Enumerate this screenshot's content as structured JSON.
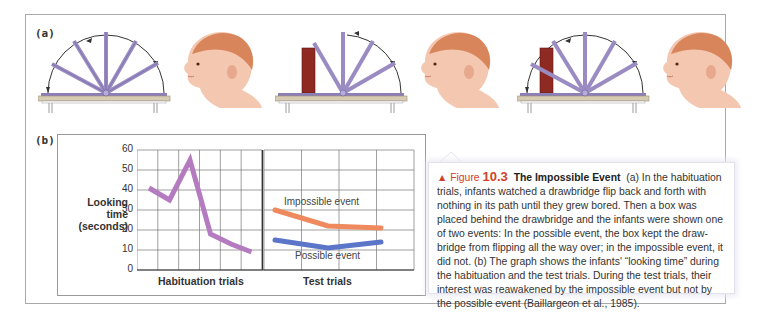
{
  "figure": {
    "panel_a_label": "(a)",
    "panel_b_label": "(b)",
    "scenes": [
      {
        "name": "habituation",
        "box": false,
        "description": "drawbridge flipping full 180 degrees, infant watching"
      },
      {
        "name": "possible-event",
        "box": true,
        "description": "box stops drawbridge, infant watching"
      },
      {
        "name": "impossible-event",
        "box": true,
        "description": "drawbridge passes through box, infant watching"
      }
    ],
    "colors": {
      "drawbridge": "#9a8cc2",
      "box": "#8e2a22",
      "table": "#d8cbb4",
      "habituation_line": "#b57bc0",
      "impossible_line": "#ef8a5e",
      "possible_line": "#5b75c9",
      "caption_accent": "#d2412a"
    }
  },
  "chart_data": {
    "type": "line",
    "title": "",
    "ylabel": "Looking time (seconds)",
    "ylabel_lines": [
      "Looking",
      "time",
      "(seconds)"
    ],
    "ylim": [
      0,
      60
    ],
    "yticks": [
      0,
      10,
      20,
      30,
      40,
      50,
      60
    ],
    "grid": true,
    "panels": [
      {
        "xlabel": "Habituation trials",
        "series": [
          {
            "name": "Habituation",
            "x": [
              1,
              2,
              3,
              4,
              5,
              6
            ],
            "values": [
              41,
              35,
              55,
              18,
              13,
              9
            ]
          }
        ]
      },
      {
        "xlabel": "Test trials",
        "series": [
          {
            "name": "Impossible event",
            "x": [
              1,
              2,
              3
            ],
            "values": [
              30,
              22,
              21
            ]
          },
          {
            "name": "Possible event",
            "x": [
              1,
              2,
              3
            ],
            "values": [
              15,
              11,
              14
            ]
          }
        ]
      }
    ]
  },
  "caption": {
    "marker": "▲",
    "figure_word": "Figure",
    "figure_number": "10.3",
    "title": "The Impossible Event",
    "body": "(a) In the habituation trials, infants watched a drawbridge flip back and forth with nothing in its path until they grew bored. Then a box was placed behind the drawbridge and the infants were shown one of two events: In the possible event, the box kept the draw-bridge from flipping all the way over; in the impossible event, it did not. (b) The graph shows the infants' “looking time” during the habituation and the test trials. During the test trials, their interest was reawakened by the impossible event but not by the possible event (Baillargeon et al., 1985)."
  }
}
